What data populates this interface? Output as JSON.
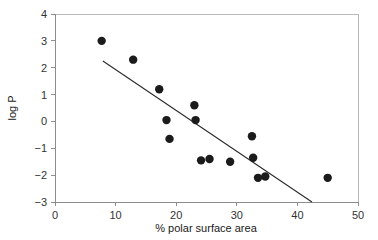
{
  "chart_data": {
    "type": "scatter",
    "title": "",
    "xlabel": "% polar surface area",
    "ylabel": "log P",
    "xlim": [
      0,
      50
    ],
    "ylim": [
      -3,
      4
    ],
    "xticks": [
      0,
      10,
      20,
      30,
      40,
      50
    ],
    "yticks": [
      -3,
      -2,
      -1,
      0,
      1,
      2,
      3,
      4
    ],
    "xtick_labels": [
      "0",
      "10",
      "20",
      "30",
      "40",
      "50"
    ],
    "ytick_labels": [
      "−3",
      "−2",
      "−1",
      "0",
      "1",
      "2",
      "3",
      "4"
    ],
    "grid": false,
    "legend": null,
    "series": [
      {
        "name": "compounds",
        "marker": "filled-circle",
        "marker_color": "#1b1b1b",
        "marker_size": 4.2,
        "points": [
          {
            "x": 7.7,
            "y": 3.0
          },
          {
            "x": 12.9,
            "y": 2.3
          },
          {
            "x": 17.2,
            "y": 1.2
          },
          {
            "x": 18.4,
            "y": 0.05
          },
          {
            "x": 18.9,
            "y": -0.65
          },
          {
            "x": 23.0,
            "y": 0.6
          },
          {
            "x": 23.2,
            "y": 0.05
          },
          {
            "x": 24.1,
            "y": -1.45
          },
          {
            "x": 25.5,
            "y": -1.4
          },
          {
            "x": 28.9,
            "y": -1.5
          },
          {
            "x": 32.5,
            "y": -0.55
          },
          {
            "x": 32.7,
            "y": -1.35
          },
          {
            "x": 33.5,
            "y": -2.1
          },
          {
            "x": 34.7,
            "y": -2.05
          },
          {
            "x": 45.0,
            "y": -2.1
          }
        ]
      }
    ],
    "trend_line": {
      "name": "regression-line",
      "color": "#2a2a2a",
      "x0": 7.9,
      "y0": 2.25,
      "x1": 42.4,
      "y1": -3.0
    }
  },
  "axes": {
    "x_axis_name": "x-axis",
    "y_axis_name": "y-axis"
  }
}
